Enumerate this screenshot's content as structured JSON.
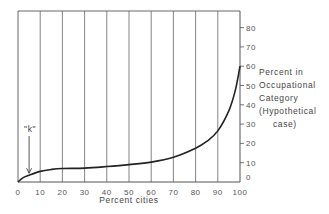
{
  "chart_data": {
    "type": "line",
    "title": "",
    "xlabel": "Percent cities",
    "ylabel": "Percent in Occupational Category (Hypothetical case)",
    "ylabel_lines": [
      "Percent in",
      "Occupational",
      "Category",
      "(Hypothetical",
      "case)"
    ],
    "x_ticks": [
      0,
      10,
      20,
      30,
      40,
      50,
      60,
      70,
      80,
      90,
      100
    ],
    "y_ticks": [
      0,
      10,
      20,
      30,
      40,
      50,
      60,
      70,
      80
    ],
    "xlim": [
      0,
      100
    ],
    "ylim": [
      0,
      88
    ],
    "grid": "vertical lines at every 10 on x",
    "y_axis_position": "right",
    "series": [
      {
        "name": "Occupational category distribution",
        "x": [
          0,
          2,
          5,
          10,
          15,
          20,
          30,
          40,
          50,
          60,
          70,
          80,
          85,
          90,
          95,
          98,
          100
        ],
        "y": [
          0,
          2,
          3.5,
          5.5,
          6.5,
          7,
          7.2,
          8,
          9,
          10.3,
          12.8,
          17.5,
          21,
          26.5,
          37,
          48,
          60
        ]
      }
    ],
    "annotations": [
      {
        "text": "\"k\"",
        "x": 5,
        "y": 3.5,
        "type": "arrow"
      }
    ]
  }
}
